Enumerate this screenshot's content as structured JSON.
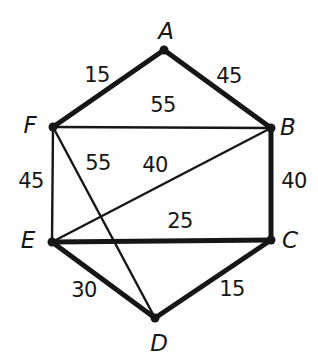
{
  "diagram": {
    "type": "weighted-graph",
    "background_color": "#fefefe",
    "stroke_color": "#161616",
    "vertex_dot_radius": 4.5,
    "thick_stroke_width": 5,
    "thin_stroke_width": 2.4,
    "vertices": [
      {
        "id": "A",
        "label": "A",
        "x": 164,
        "y": 50,
        "label_x": 166,
        "label_y": 31
      },
      {
        "id": "B",
        "label": "B",
        "x": 271,
        "y": 128,
        "label_x": 288,
        "label_y": 127
      },
      {
        "id": "C",
        "label": "C",
        "x": 271,
        "y": 240,
        "label_x": 290,
        "label_y": 240
      },
      {
        "id": "D",
        "label": "D",
        "x": 155,
        "y": 318,
        "label_x": 159,
        "label_y": 343
      },
      {
        "id": "E",
        "label": "E",
        "x": 52,
        "y": 242,
        "label_x": 28,
        "label_y": 240
      },
      {
        "id": "F",
        "label": "F",
        "x": 53,
        "y": 127,
        "label_x": 30,
        "label_y": 125
      }
    ],
    "edges": [
      {
        "from": "A",
        "to": "F",
        "weight": "15",
        "thick": true,
        "label_x": 97,
        "label_y": 75
      },
      {
        "from": "A",
        "to": "B",
        "weight": "45",
        "thick": true,
        "label_x": 229,
        "label_y": 76
      },
      {
        "from": "F",
        "to": "B",
        "weight": "55",
        "thick": false,
        "label_x": 163,
        "label_y": 105
      },
      {
        "from": "F",
        "to": "E",
        "weight": "45",
        "thick": false,
        "label_x": 31,
        "label_y": 181
      },
      {
        "from": "F",
        "to": "D",
        "weight": "55",
        "thick": false,
        "label_x": 98,
        "label_y": 163
      },
      {
        "from": "E",
        "to": "B",
        "weight": "40",
        "thick": false,
        "label_x": 155,
        "label_y": 165
      },
      {
        "from": "B",
        "to": "C",
        "weight": "40",
        "thick": true,
        "label_x": 294,
        "label_y": 181
      },
      {
        "from": "E",
        "to": "C",
        "weight": "25",
        "thick": true,
        "label_x": 180,
        "label_y": 221
      },
      {
        "from": "E",
        "to": "D",
        "weight": "30",
        "thick": true,
        "label_x": 84,
        "label_y": 290
      },
      {
        "from": "D",
        "to": "C",
        "weight": "15",
        "thick": true,
        "label_x": 232,
        "label_y": 289
      }
    ]
  }
}
